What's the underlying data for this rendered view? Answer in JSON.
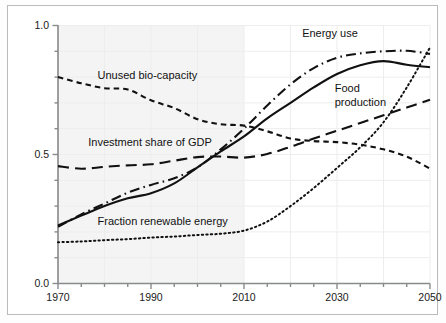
{
  "chart_data": {
    "type": "line",
    "title": "",
    "subtitle": "",
    "xlabel": "",
    "ylabel": "",
    "xlim": [
      1970,
      2050
    ],
    "ylim": [
      0.0,
      1.0
    ],
    "x_ticks": [
      1970,
      1990,
      2010,
      2030,
      2050
    ],
    "x_tick_labels": [
      "1970",
      "1990",
      "2010",
      "2030",
      "2050"
    ],
    "x_minor_step": 5,
    "y_ticks": [
      0.0,
      0.5,
      1.0
    ],
    "y_tick_labels": [
      "0.0",
      "0.5",
      "1.0"
    ],
    "y_minor_step": 0.1,
    "grid": true,
    "legend_position": "inline-annotations",
    "shaded_region": {
      "from": 1970,
      "to": 2010,
      "color": "#f4f4f4",
      "meaning": "history"
    },
    "x": [
      1970,
      1975,
      1980,
      1985,
      1990,
      1995,
      2000,
      2005,
      2010,
      2015,
      2020,
      2025,
      2030,
      2035,
      2040,
      2045,
      2050
    ],
    "series": [
      {
        "name": "Unused bio-capacity",
        "style": "short-dash",
        "color": "#111111",
        "label_x": 1981,
        "label_y": 0.795,
        "values": [
          0.8,
          0.776,
          0.757,
          0.752,
          0.71,
          0.68,
          0.637,
          0.617,
          0.612,
          0.59,
          0.562,
          0.552,
          0.548,
          0.538,
          0.52,
          0.492,
          0.445
        ]
      },
      {
        "name": "Investment share of GDP",
        "style": "long-dash",
        "color": "#111111",
        "label_x": 1980,
        "label_y": 0.53,
        "values": [
          0.455,
          0.445,
          0.452,
          0.458,
          0.462,
          0.476,
          0.49,
          0.492,
          0.488,
          0.502,
          0.53,
          0.562,
          0.592,
          0.622,
          0.652,
          0.682,
          0.712
        ]
      },
      {
        "name": "Food production",
        "style": "solid",
        "color": "#111111",
        "label_x": 2030,
        "label_y": 0.7,
        "values": [
          0.225,
          0.263,
          0.3,
          0.33,
          0.35,
          0.388,
          0.45,
          0.512,
          0.57,
          0.64,
          0.7,
          0.76,
          0.812,
          0.846,
          0.862,
          0.848,
          0.838
        ]
      },
      {
        "name": "Energy use",
        "style": "dash-dot",
        "color": "#111111",
        "label_x": 2027,
        "label_y": 0.95,
        "values": [
          0.22,
          0.268,
          0.31,
          0.352,
          0.382,
          0.408,
          0.45,
          0.52,
          0.6,
          0.69,
          0.772,
          0.835,
          0.875,
          0.892,
          0.9,
          0.902,
          0.89
        ]
      },
      {
        "name": "Fraction renewable energy",
        "style": "dotted",
        "color": "#111111",
        "label_x": 1982,
        "label_y": 0.23,
        "values": [
          0.16,
          0.163,
          0.168,
          0.172,
          0.178,
          0.182,
          0.188,
          0.193,
          0.205,
          0.24,
          0.3,
          0.37,
          0.448,
          0.528,
          0.625,
          0.76,
          0.915
        ]
      }
    ]
  },
  "annotations": {
    "energy_use": "Energy use",
    "food_production_line1": "Food",
    "food_production_line2": "production",
    "unused_biocapacity": "Unused bio-capacity",
    "investment_share": "Investment share of GDP",
    "fraction_renewable": "Fraction renewable energy"
  },
  "axis": {
    "y_label_top": "1.0",
    "y_label_mid": "0.5",
    "y_label_bottom": "0.0",
    "x_label_1": "1970",
    "x_label_2": "1990",
    "x_label_3": "2010",
    "x_label_4": "2030",
    "x_label_5": "2050"
  },
  "colors": {
    "line": "#111111",
    "axis": "#888a8c",
    "grid": "#ededed",
    "history_shade": "#f4f4f4",
    "frame": "#b9bcbe",
    "page_background": "#fdfdfd",
    "plot_background": "#ffffff"
  }
}
